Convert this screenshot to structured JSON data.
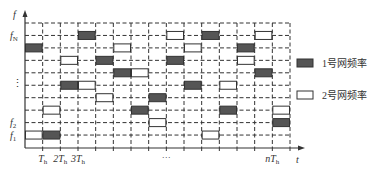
{
  "diagram": {
    "type": "frequency-hopping-time-frequency-grid",
    "y_axis": {
      "label": "f",
      "row_labels": [
        {
          "row": 1,
          "text": "f",
          "sub": "N"
        },
        {
          "row": 5,
          "text": "⋮",
          "sub": ""
        },
        {
          "row": 8,
          "text": "f",
          "sub": "2"
        },
        {
          "row": 9,
          "text": "f",
          "sub": "1"
        }
      ]
    },
    "x_axis": {
      "label": "t",
      "tick_labels": [
        {
          "col_edge": 1,
          "text": "T",
          "sub": "h"
        },
        {
          "col_edge": 2,
          "text": "2T",
          "sub": "h"
        },
        {
          "col_edge": 3,
          "text": "3T",
          "sub": "h"
        },
        {
          "col_edge": 8,
          "text": "···",
          "sub": ""
        },
        {
          "col_edge": 14,
          "text": "nT",
          "sub": "h"
        }
      ]
    },
    "grid": {
      "columns": 15,
      "rows": 10
    },
    "blocks": [
      {
        "col": 0,
        "row": 2,
        "net": 1
      },
      {
        "col": 0,
        "row": 9,
        "net": 2
      },
      {
        "col": 1,
        "row": 7,
        "net": 2
      },
      {
        "col": 1,
        "row": 9,
        "net": 1
      },
      {
        "col": 2,
        "row": 3,
        "net": 2
      },
      {
        "col": 2,
        "row": 5,
        "net": 1
      },
      {
        "col": 3,
        "row": 1,
        "net": 1
      },
      {
        "col": 3,
        "row": 5,
        "net": 2
      },
      {
        "col": 4,
        "row": 3,
        "net": 1
      },
      {
        "col": 4,
        "row": 6,
        "net": 2
      },
      {
        "col": 5,
        "row": 2,
        "net": 2
      },
      {
        "col": 5,
        "row": 4,
        "net": 1
      },
      {
        "col": 6,
        "row": 4,
        "net": 2
      },
      {
        "col": 6,
        "row": 7,
        "net": 1
      },
      {
        "col": 7,
        "row": 6,
        "net": 1
      },
      {
        "col": 7,
        "row": 8,
        "net": 2
      },
      {
        "col": 8,
        "row": 1,
        "net": 2
      },
      {
        "col": 8,
        "row": 3,
        "net": 1
      },
      {
        "col": 9,
        "row": 2,
        "net": 2
      },
      {
        "col": 9,
        "row": 5,
        "net": 1
      },
      {
        "col": 10,
        "row": 1,
        "net": 1
      },
      {
        "col": 10,
        "row": 9,
        "net": 2
      },
      {
        "col": 11,
        "row": 5,
        "net": 2
      },
      {
        "col": 11,
        "row": 7,
        "net": 1
      },
      {
        "col": 12,
        "row": 2,
        "net": 1
      },
      {
        "col": 12,
        "row": 3,
        "net": 2
      },
      {
        "col": 13,
        "row": 1,
        "net": 2
      },
      {
        "col": 13,
        "row": 4,
        "net": 1
      },
      {
        "col": 14,
        "row": 7,
        "net": 2
      },
      {
        "col": 14,
        "row": 8,
        "net": 1
      }
    ],
    "legend": [
      {
        "net": 1,
        "label": "1号网频率",
        "fill": "#555555"
      },
      {
        "net": 2,
        "label": "2号网频率",
        "fill": "#ffffff"
      }
    ],
    "colors": {
      "line": "#333333",
      "net1": "#555555",
      "net2": "#ffffff"
    }
  }
}
